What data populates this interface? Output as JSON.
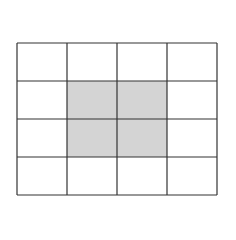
{
  "diagram": {
    "type": "grid",
    "rows": 4,
    "cols": 4,
    "cell_width": 50,
    "cell_height": 38,
    "line_color": "#333333",
    "fill_color": "#d4d4d4",
    "background": "#ffffff",
    "shaded_cells": [
      [
        1,
        1
      ],
      [
        1,
        2
      ],
      [
        2,
        1
      ],
      [
        2,
        2
      ]
    ]
  }
}
